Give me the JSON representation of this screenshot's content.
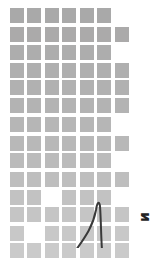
{
  "grid": {
    "col_lefts": [
      10,
      27,
      45,
      62,
      80,
      97,
      115
    ],
    "cell_size": [
      14,
      15
    ],
    "rows": [
      {
        "top": 8,
        "cols": [
          0,
          1,
          2,
          3,
          4,
          5
        ],
        "color": "#a9a9a9"
      },
      {
        "top": 27,
        "cols": [
          0,
          1,
          2,
          3,
          4,
          5,
          6
        ],
        "color": "#abaaaa"
      },
      {
        "top": 45,
        "cols": [
          0,
          1,
          2,
          3,
          4,
          5
        ],
        "color": "#adadad"
      },
      {
        "top": 63,
        "cols": [
          0,
          1,
          2,
          3,
          4,
          5,
          6
        ],
        "color": "#afafaf"
      },
      {
        "top": 80,
        "cols": [
          0,
          1,
          2,
          3,
          4,
          5,
          6
        ],
        "color": "#b1b1b1"
      },
      {
        "top": 98,
        "cols": [
          0,
          1,
          2,
          3,
          4,
          5,
          6
        ],
        "color": "#b3b3b3"
      },
      {
        "top": 117,
        "cols": [
          0,
          1,
          2,
          3,
          4,
          5
        ],
        "color": "#b6b6b6"
      },
      {
        "top": 136,
        "cols": [
          0,
          1,
          2,
          3,
          4,
          5,
          6
        ],
        "color": "#b8b8b8"
      },
      {
        "top": 153,
        "cols": [
          0,
          1,
          2,
          3,
          4,
          5
        ],
        "color": "#bbbbbb"
      },
      {
        "top": 172,
        "cols": [
          0,
          1,
          2,
          3,
          4,
          5,
          6
        ],
        "color": "#bebebe"
      },
      {
        "top": 190,
        "cols": [
          0,
          1,
          3,
          4,
          5
        ],
        "color": "#c2c2c2"
      },
      {
        "top": 207,
        "cols": [
          0,
          1,
          2,
          3,
          4,
          5,
          6
        ],
        "color": "#c5c5c5"
      },
      {
        "top": 226,
        "cols": [
          0,
          2,
          3,
          4,
          5,
          6
        ],
        "color": "#c8c8c8"
      },
      {
        "top": 243,
        "cols": [
          0,
          1,
          2,
          3,
          4,
          5,
          6
        ],
        "color": "#cacaca"
      }
    ]
  },
  "curve": {
    "path": "M 76 250 C 86 236, 93 226, 96 210 C 97 203, 99 200, 100 206 C 101 220, 101 236, 102 250",
    "color": "#3a3a3a",
    "width": 2
  },
  "edge_glyph": {
    "text": "ᴎ"
  }
}
